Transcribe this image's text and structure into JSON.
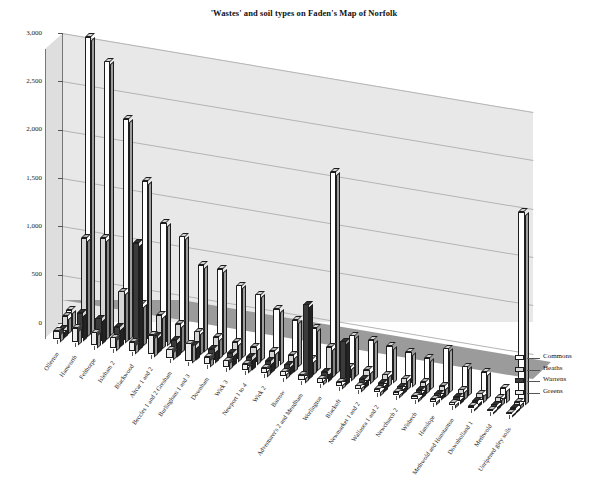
{
  "chart_data": {
    "type": "bar",
    "title": "'Wastes' and soil types on Faden's Map of Norfolk",
    "xlabel": "",
    "ylabel": "",
    "ylim": [
      0,
      3000
    ],
    "ytick_values": [
      0,
      500,
      1000,
      1500,
      2000,
      2500,
      3000
    ],
    "ytick_labels": [
      "0",
      "500",
      "1,000",
      "1,500",
      "2,000",
      "2,500",
      "3,000"
    ],
    "grid": true,
    "legend_position": "right",
    "projection": "3d",
    "categories": [
      "Ollerton",
      "Hanworth",
      "Felthorpe",
      "Isleham 2",
      "Blackwood",
      "Altcar 1 and 2",
      "Beccles 1 and 2 Gresham",
      "Burlingham 1 and 3",
      "Downham",
      "Wick 3",
      "Newport 1 to 4",
      "Wick 2",
      "Barrow",
      "Adventurer's 2 and Mendham",
      "Worlington",
      "Blackoft",
      "Newmarket 1 and 2",
      "Wallasea 1 and 2",
      "Newchurch 2",
      "Wisbech",
      "Hanslope",
      "Methwold and Hunstanton",
      "Downholland 1",
      "Methwold",
      "Unripened gley soils"
    ],
    "series": [
      {
        "name": "Commons",
        "color": "#ffffff",
        "values": [
          175,
          3030,
          2810,
          2250,
          1640,
          1240,
          1130,
          870,
          860,
          720,
          660,
          545,
          460,
          410,
          2060,
          400,
          385,
          355,
          330,
          300,
          430,
          275,
          250,
          120,
          1970
        ]
      },
      {
        "name": "Heaths",
        "color": "#d6d6d6",
        "values": [
          150,
          990,
          1025,
          505,
          405,
          325,
          265,
          220,
          195,
          180,
          160,
          150,
          140,
          130,
          290,
          120,
          115,
          105,
          95,
          90,
          85,
          80,
          70,
          60,
          45
        ]
      },
      {
        "name": "Warrens",
        "color": "#3a3a3a",
        "values": [
          60,
          255,
          235,
          180,
          1080,
          155,
          140,
          125,
          115,
          105,
          100,
          90,
          85,
          740,
          75,
          420,
          65,
          60,
          55,
          50,
          45,
          40,
          35,
          30,
          25
        ]
      },
      {
        "name": "Greens",
        "color": "#ededed",
        "values": [
          80,
          145,
          130,
          110,
          95,
          200,
          85,
          180,
          75,
          70,
          65,
          60,
          55,
          50,
          45,
          45,
          40,
          38,
          35,
          32,
          30,
          28,
          25,
          20,
          15
        ]
      }
    ]
  },
  "legend": {
    "items": [
      {
        "label": "Commons"
      },
      {
        "label": "Heaths"
      },
      {
        "label": "Warrens"
      },
      {
        "label": "Greens"
      }
    ]
  }
}
